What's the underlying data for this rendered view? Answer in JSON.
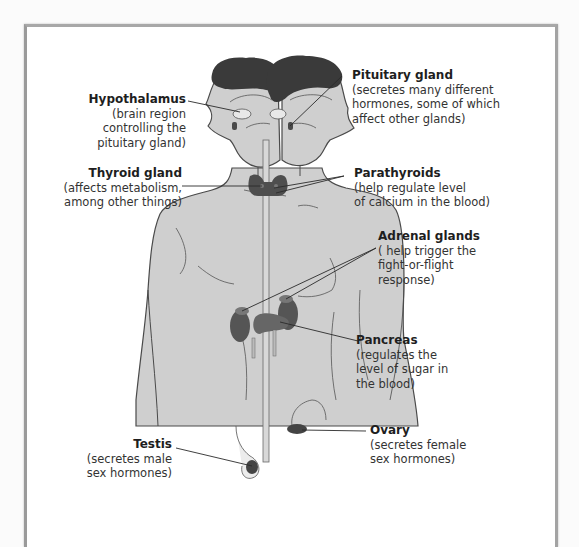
{
  "diagram": {
    "type": "anatomical-labeled-diagram",
    "colors": {
      "body_fill": "#cfcfcf",
      "hair_fill": "#3a3a3a",
      "gland_fill": "#555555",
      "outline": "#4a4a4a",
      "leader_line": "#2a2a2a",
      "frame": "#a0a0a0"
    }
  },
  "labels": {
    "hypothalamus": {
      "title": "Hypothalamus",
      "desc": "(brain region\ncontrolling the\npituitary gland)"
    },
    "pituitary": {
      "title": "Pituitary gland",
      "desc": "(secretes many different\nhormones, some of which\naffect other glands)"
    },
    "thyroid": {
      "title": "Thyroid gland",
      "desc": "(affects metabolism,\namong other things)"
    },
    "parathyroids": {
      "title": "Parathyroids",
      "desc": "(help regulate level\nof calcium in the blood)"
    },
    "adrenal": {
      "title": "Adrenal glands",
      "desc": "( help trigger the\nfight-or-flight\nresponse)"
    },
    "pancreas": {
      "title": "Pancreas",
      "desc": "(regulates the\nlevel of sugar in\nthe blood)"
    },
    "ovary": {
      "title": "Ovary",
      "desc": "(secretes female\nsex hormones)"
    },
    "testis": {
      "title": "Testis",
      "desc": "(secretes male\nsex hormones)"
    }
  }
}
